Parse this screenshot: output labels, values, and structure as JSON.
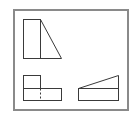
{
  "diagram": {
    "type": "orthographic-projection",
    "views": [
      "front-view",
      "top-view",
      "side-view"
    ],
    "colors": {
      "background": "#ffffff",
      "frame": "#8a8a8a",
      "line": "#3a3a3a"
    }
  }
}
